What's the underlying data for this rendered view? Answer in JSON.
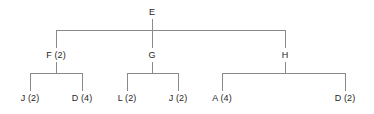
{
  "diagram": {
    "type": "tree",
    "title": "",
    "line_color": "#8a8a8a",
    "text_color": "#262626",
    "background": "#ffffff",
    "levels": 3,
    "root": {
      "id": "E",
      "label": "E",
      "x": 152,
      "y": 12
    },
    "level2": [
      {
        "id": "F",
        "label": "F (2)",
        "count": 2,
        "x": 56,
        "y": 55
      },
      {
        "id": "G",
        "label": "G",
        "count": null,
        "x": 152,
        "y": 55
      },
      {
        "id": "H",
        "label": "H",
        "count": null,
        "x": 285,
        "y": 55
      }
    ],
    "level3": [
      {
        "id": "J1",
        "label": "J (2)",
        "count": 2,
        "parent": "F",
        "x": 30,
        "y": 98
      },
      {
        "id": "D1",
        "label": "D (4)",
        "count": 4,
        "parent": "F",
        "x": 82,
        "y": 98
      },
      {
        "id": "L1",
        "label": "L (2)",
        "count": 2,
        "parent": "G",
        "x": 127,
        "y": 98
      },
      {
        "id": "J2",
        "label": "J (2)",
        "count": 2,
        "parent": "G",
        "x": 178,
        "y": 98
      },
      {
        "id": "A1",
        "label": "A (4)",
        "count": 4,
        "parent": "H",
        "x": 222,
        "y": 98
      },
      {
        "id": "D2",
        "label": "D (2)",
        "count": 2,
        "parent": "H",
        "x": 345,
        "y": 98
      }
    ],
    "connectors": {
      "root_bar": {
        "y": 30,
        "x1": 56,
        "x2": 285
      },
      "root_stem": {
        "x": 152,
        "y1": 19,
        "y2": 30
      },
      "branch_stems": [
        {
          "x": 56,
          "y1": 30,
          "y2": 48
        },
        {
          "x": 152,
          "y1": 30,
          "y2": 48
        },
        {
          "x": 285,
          "y1": 30,
          "y2": 48
        }
      ],
      "child_bars": [
        {
          "parent": "F",
          "y": 73,
          "x1": 30,
          "x2": 82
        },
        {
          "parent": "G",
          "y": 73,
          "x1": 127,
          "x2": 178
        },
        {
          "parent": "H",
          "y": 73,
          "x1": 222,
          "x2": 345
        }
      ],
      "parent_drops": [
        {
          "x": 56,
          "y1": 62,
          "y2": 73
        },
        {
          "x": 152,
          "y1": 62,
          "y2": 73
        },
        {
          "x": 285,
          "y1": 62,
          "y2": 73
        }
      ],
      "leaf_stems": [
        {
          "x": 30,
          "y1": 73,
          "y2": 91
        },
        {
          "x": 82,
          "y1": 73,
          "y2": 91
        },
        {
          "x": 127,
          "y1": 73,
          "y2": 91
        },
        {
          "x": 178,
          "y1": 73,
          "y2": 91
        },
        {
          "x": 222,
          "y1": 73,
          "y2": 91
        },
        {
          "x": 345,
          "y1": 73,
          "y2": 91
        }
      ]
    }
  }
}
